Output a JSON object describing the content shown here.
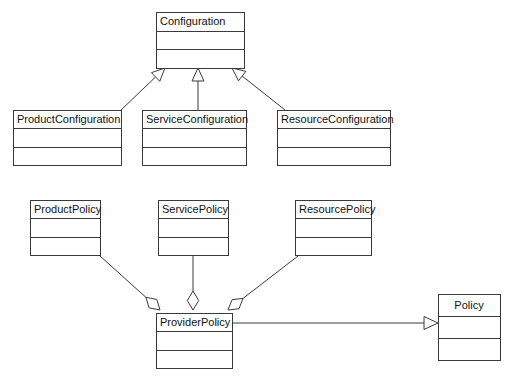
{
  "diagram": {
    "kind": "uml-class-diagram",
    "width": 517,
    "height": 379,
    "background_color": "#ffffff",
    "line_color": "#3a3a3a",
    "text_color": "#111111",
    "classes": [
      {
        "id": "configuration",
        "name": "Configuration",
        "x": 156,
        "y": 12,
        "width": 88,
        "height": 56,
        "title_align": "left",
        "compartments": [
          "",
          ""
        ]
      },
      {
        "id": "product-configuration",
        "name": "ProductConfiguration",
        "x": 13,
        "y": 110,
        "width": 108,
        "height": 55,
        "title_align": "left",
        "compartments": [
          "",
          ""
        ]
      },
      {
        "id": "service-configuration",
        "name": "ServiceConfiguration",
        "x": 142,
        "y": 110,
        "width": 104,
        "height": 55,
        "title_align": "left",
        "compartments": [
          "",
          ""
        ]
      },
      {
        "id": "resource-configuration",
        "name": "ResourceConfiguration",
        "x": 277,
        "y": 110,
        "width": 113,
        "height": 55,
        "title_align": "left",
        "compartments": [
          "",
          ""
        ]
      },
      {
        "id": "product-policy",
        "name": "ProductPolicy",
        "x": 30,
        "y": 200,
        "width": 70,
        "height": 55,
        "title_align": "left",
        "compartments": [
          "",
          ""
        ]
      },
      {
        "id": "service-policy",
        "name": "ServicePolicy",
        "x": 158,
        "y": 200,
        "width": 70,
        "height": 55,
        "title_align": "left",
        "compartments": [
          "",
          ""
        ]
      },
      {
        "id": "resource-policy",
        "name": "ResourcePolicy",
        "x": 295,
        "y": 200,
        "width": 76,
        "height": 55,
        "title_align": "left",
        "compartments": [
          "",
          ""
        ]
      },
      {
        "id": "provider-policy",
        "name": "ProviderPolicy",
        "x": 156,
        "y": 313,
        "width": 76,
        "height": 55,
        "title_align": "left",
        "compartments": [
          "",
          ""
        ]
      },
      {
        "id": "policy",
        "name": "Policy",
        "x": 438,
        "y": 294,
        "width": 62,
        "height": 66,
        "title_align": "center",
        "compartments": [
          "",
          ""
        ]
      }
    ],
    "relationships": [
      {
        "id": "rel-productconfiguration-configuration",
        "type": "generalization",
        "from": "product-configuration",
        "to": "configuration",
        "label": ""
      },
      {
        "id": "rel-serviceconfiguration-configuration",
        "type": "generalization",
        "from": "service-configuration",
        "to": "configuration",
        "label": ""
      },
      {
        "id": "rel-resourceconfiguration-configuration",
        "type": "generalization",
        "from": "resource-configuration",
        "to": "configuration",
        "label": ""
      },
      {
        "id": "rel-providerpolicy-policy",
        "type": "generalization",
        "from": "provider-policy",
        "to": "policy",
        "label": ""
      },
      {
        "id": "rel-productpolicy-providerpolicy",
        "type": "aggregation",
        "from": "product-policy",
        "to": "provider-policy",
        "label": ""
      },
      {
        "id": "rel-servicepolicy-providerpolicy",
        "type": "aggregation",
        "from": "service-policy",
        "to": "provider-policy",
        "label": ""
      },
      {
        "id": "rel-resourcepolicy-providerpolicy",
        "type": "aggregation",
        "from": "resource-policy",
        "to": "provider-policy",
        "label": ""
      },
      {
        "id": "rel-configuration-policy",
        "type": "association",
        "from": "configuration",
        "to": "policy",
        "label": ""
      }
    ]
  }
}
